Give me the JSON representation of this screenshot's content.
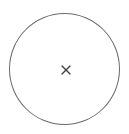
{
  "close_button": {
    "label": "Close",
    "icon": "close-icon",
    "stroke_color": "#6a6a6a",
    "icon_color": "#404040",
    "background": "#ffffff"
  }
}
